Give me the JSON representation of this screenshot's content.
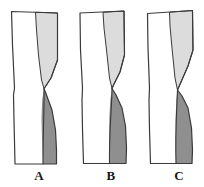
{
  "figure": {
    "type": "diagram",
    "title": "",
    "background_color": "#ffffff",
    "width": 204,
    "height": 187,
    "style": {
      "outline_color": "#3a3a3a",
      "outline_width": 1.1,
      "white_fill": "#ffffff",
      "light_gray_fill": "#dcdcdc",
      "dark_gray_fill": "#8f8f8f",
      "label_color": "#1a1a1a"
    },
    "panels": [
      {
        "id": "a",
        "label": "A",
        "label_x": 39,
        "label_y": 176,
        "description": "column with light-gray upper-right wedge and dark-gray lower-right crescent crossing at waist",
        "outline_path": "M 11.5 11.5 L 57.5 13.0 L 57.5 60.0 L 51.0 78.0 L 45.5 86.5 L 44.0 88.5 L 46.5 95.0 L 52.0 110.0 L 55.5 130.0 L 56.5 150.0 L 56.5 164.0 L 15.0 164.0 L 14.0 120.0 L 13.5 95.0 L 14.5 88.0 L 12.5 45.0 Z",
        "light_region_path": "M 35.5 12.2 L 57.5 13.0 L 57.5 60.0 L 51.0 78.0 L 45.5 86.5 L 44.0 88.5 L 41.5 80.0 L 38.5 55.0 L 36.5 30.0 Z",
        "dark_region_path": "M 44.0 88.5 L 46.5 95.0 L 52.0 110.0 L 55.5 130.0 L 56.5 150.0 L 56.5 164.0 L 43.0 164.0 L 42.0 140.0 L 41.5 118.0 L 42.2 100.0 Z",
        "inner_curve_path": "M 44.0 88.5 C 44.5 100.0 43.0 130.0 43.0 164.0",
        "crossing_point": {
          "x": 44,
          "y": 88.5
        }
      },
      {
        "id": "b",
        "label": "B",
        "label_x": 111,
        "label_y": 176,
        "description": "column with light-gray upper-right wedge and wider dark-gray lower-right crescent",
        "outline_path": "M 80.0 13.0 L 124.0 11.0 L 124.5 55.0 L 120.0 72.0 L 114.0 84.0 L 112.0 88.5 L 116.0 95.0 L 122.0 108.0 L 125.5 126.0 L 126.5 148.0 L 126.0 163.5 L 83.5 163.5 L 82.5 130.0 L 82.0 100.0 L 82.5 88.0 L 80.5 50.0 Z",
        "light_region_path": "M 103.0 12.3 L 124.0 11.0 L 124.5 55.0 L 120.0 72.0 L 114.0 84.0 L 112.0 88.5 L 109.5 78.0 L 106.5 50.0 L 104.0 28.0 Z",
        "dark_region_path": "M 112.0 88.5 L 116.0 95.0 L 122.0 108.0 L 125.5 126.0 L 126.5 148.0 L 126.0 163.5 L 109.5 163.5 L 109.0 140.0 L 109.3 118.0 L 110.3 100.0 Z",
        "inner_curve_path": "M 112.0 88.5 C 112.0 104.0 109.0 132.0 109.5 163.5",
        "crossing_point": {
          "x": 112,
          "y": 88.5
        }
      },
      {
        "id": "c",
        "label": "C",
        "label_x": 179,
        "label_y": 176,
        "description": "column with large light-gray upper-right wedge and compact dark-gray lower-right lobe",
        "outline_path": "M 147.5 13.5 L 192.5 10.5 L 193.0 50.0 L 188.0 66.0 L 181.0 82.0 L 177.5 90.0 L 182.0 96.0 L 188.0 108.0 L 191.5 128.0 L 192.5 150.0 L 192.0 163.5 L 150.5 163.5 L 149.5 130.0 L 149.0 100.0 L 149.5 88.0 L 148.0 48.0 Z",
        "light_region_path": "M 169.5 12.2 L 192.5 10.5 L 193.0 50.0 L 188.0 66.0 L 181.0 82.0 L 177.5 90.0 L 175.0 78.0 L 172.0 48.0 L 170.0 26.0 Z",
        "dark_region_path": "M 177.5 90.0 L 182.0 96.0 L 188.0 108.0 L 191.5 128.0 L 192.5 150.0 L 192.0 163.5 L 176.0 163.5 L 175.5 140.0 L 175.6 118.0 L 176.3 100.0 Z",
        "inner_curve_path": "M 177.5 90.0 C 177.0 106.0 175.0 132.0 176.0 163.5",
        "crossing_point": {
          "x": 177.5,
          "y": 90
        }
      }
    ]
  }
}
